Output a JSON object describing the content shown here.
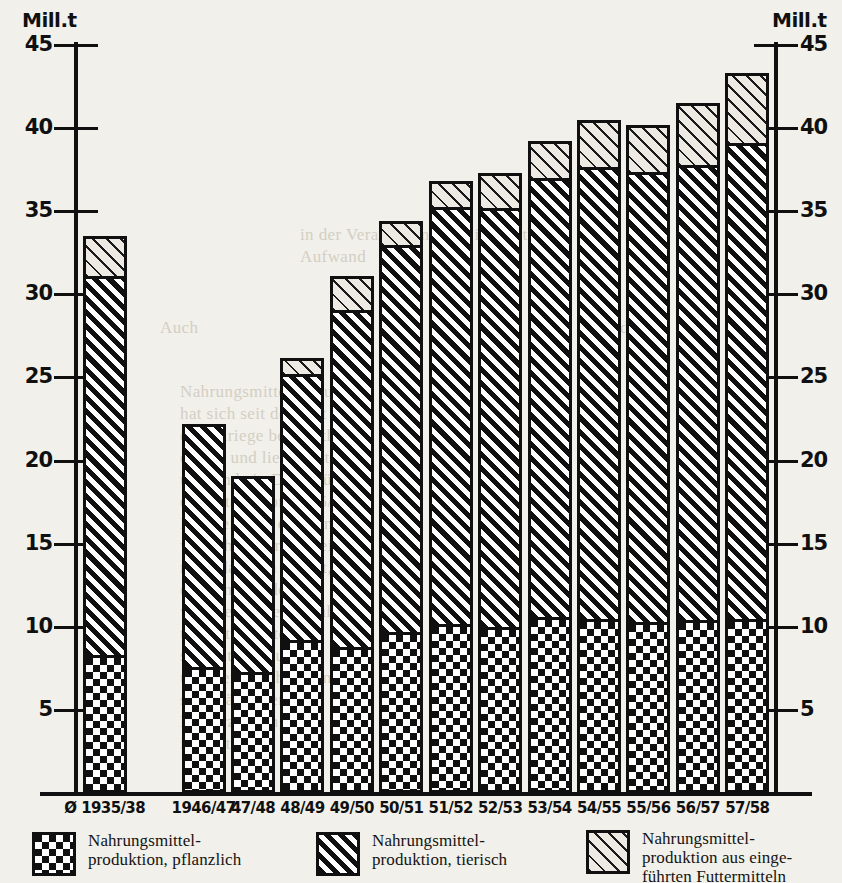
{
  "axis": {
    "unit_label_left": "Mill.t",
    "unit_label_right": "Mill.t",
    "ticks": [
      45,
      40,
      35,
      30,
      25,
      20,
      15,
      10,
      5
    ],
    "min": 0,
    "max": 45
  },
  "legend": [
    {
      "pattern": "checkerboard",
      "line1": "Nahrungsmittel-",
      "line2": "produktion, pflanzlich",
      "line3": ""
    },
    {
      "pattern": "dark-diagonal-hatch",
      "line1": "Nahrungsmittel-",
      "line2": "produktion, tierisch",
      "line3": ""
    },
    {
      "pattern": "light-diagonal-hatch",
      "line1": "Nahrungsmittel-",
      "line2": "produktion aus einge-",
      "line3": "führten Futtermitteln"
    }
  ],
  "chart_data": {
    "type": "bar",
    "title": "",
    "subtitle": "",
    "xlabel": "",
    "ylabel": "Mill.t",
    "ylim": [
      0,
      45
    ],
    "ytick_step": 5,
    "grid": false,
    "stacked": true,
    "legend_position": "bottom",
    "categories": [
      "Ø 1935/38",
      "1946/47",
      "47/48",
      "48/49",
      "49/50",
      "50/51",
      "51/52",
      "52/53",
      "53/54",
      "54/55",
      "55/56",
      "56/57",
      "57/58"
    ],
    "series": [
      {
        "name": "Nahrungsmittelproduktion, pflanzlich",
        "pattern": "checkerboard",
        "values": [
          8.1,
          7.4,
          7.1,
          9.0,
          8.6,
          9.5,
          10.0,
          9.8,
          10.4,
          10.3,
          10.1,
          10.2,
          10.3
        ]
      },
      {
        "name": "Nahrungsmittelproduktion, tierisch",
        "pattern": "dark-diagonal-hatch",
        "values": [
          22.8,
          14.8,
          12.0,
          16.0,
          20.3,
          23.3,
          25.1,
          25.2,
          26.4,
          27.2,
          27.1,
          27.4,
          28.6
        ]
      },
      {
        "name": "Nahrungsmittelproduktion aus eingeführten Futtermitteln",
        "pattern": "light-diagonal-hatch",
        "values": [
          2.6,
          0.0,
          0.0,
          1.2,
          2.2,
          1.6,
          1.7,
          2.3,
          2.4,
          3.0,
          3.0,
          3.9,
          4.4
        ]
      }
    ],
    "totals": [
      33.5,
      22.2,
      19.1,
      26.2,
      31.1,
      34.4,
      36.8,
      37.3,
      39.2,
      40.5,
      40.2,
      41.5,
      43.3
    ],
    "note_gap_after_index": 0
  },
  "ghost_text": [
    {
      "t": "in der Verarbeitung und im Vertrieb",
      "x": 300,
      "y": 225,
      "size": 17
    },
    {
      "t": "Aufwand",
      "x": 300,
      "y": 247,
      "size": 17
    },
    {
      "t": "Auch",
      "x": 160,
      "y": 318,
      "size": 17
    },
    {
      "t": "der",
      "x": 620,
      "y": 318,
      "size": 17
    },
    {
      "t": "Nahrungsmittelproduktion",
      "x": 180,
      "y": 382,
      "size": 17
    },
    {
      "t": "hat sich seit der Zeit vor",
      "x": 180,
      "y": 404,
      "size": 17
    },
    {
      "t": "dem Kriege beträchtlich",
      "x": 180,
      "y": 426,
      "size": 17
    },
    {
      "t": "erhöht und liegt heute",
      "x": 180,
      "y": 448,
      "size": 17
    },
    {
      "t": "um rund ein Drittel über",
      "x": 180,
      "y": 470,
      "size": 17
    },
    {
      "t": "dem Stand von 1935/38.",
      "x": 180,
      "y": 492,
      "size": 17
    },
    {
      "t": "Die Leistung der Land-",
      "x": 180,
      "y": 514,
      "size": 17
    },
    {
      "t": "wirtschaft wird dabei",
      "x": 180,
      "y": 536,
      "size": 17
    },
    {
      "t": "noch dadurch erhöht,",
      "x": 180,
      "y": 558,
      "size": 17
    },
    {
      "t": "daß ein Teil des Zu-",
      "x": 180,
      "y": 580,
      "size": 17
    },
    {
      "t": "wachses aus eingeführ-",
      "x": 180,
      "y": 602,
      "size": 17
    },
    {
      "t": "ten Futtermitteln",
      "x": 180,
      "y": 624,
      "size": 17
    },
    {
      "t": "stammt. Produktion",
      "x": 180,
      "y": 646,
      "size": 17
    },
    {
      "t": "und Verbrauch haben",
      "x": 180,
      "y": 668,
      "size": 17
    },
    {
      "t": "sich ständig erhöht.",
      "x": 180,
      "y": 690,
      "size": 17
    },
    {
      "t": "Die Erzeugung",
      "x": 180,
      "y": 712,
      "size": 17
    },
    {
      "t": "ist gestiegen.",
      "x": 180,
      "y": 734,
      "size": 17
    }
  ]
}
